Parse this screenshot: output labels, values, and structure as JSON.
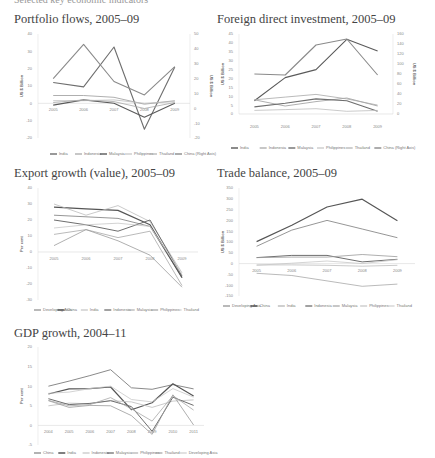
{
  "header": {
    "text": "Selected key economic indicators"
  },
  "chart_data": [
    {
      "id": "portfolio",
      "type": "line",
      "title": "Portfolio flows, 2005–09",
      "ylabel": "US $ Billion",
      "ylabel_right": "US $ Billion",
      "x": [
        "2005",
        "2006",
        "2007",
        "2008",
        "2009"
      ],
      "ylim": [
        -20,
        40
      ],
      "yticks": [
        40,
        30,
        20,
        10,
        0,
        -10,
        -20
      ],
      "ylim_right": [
        -20,
        50
      ],
      "yticks_right": [
        50,
        40,
        30,
        20,
        10,
        0,
        -10,
        -20
      ],
      "series": [
        {
          "name": "India",
          "values": [
            12,
            9.5,
            32.5,
            -15,
            21
          ],
          "color": "#6e6e6e",
          "width": 1.1
        },
        {
          "name": "Indonesia",
          "values": [
            4.5,
            4.5,
            3.5,
            -0.5,
            1.5
          ],
          "color": "#9a9a9a",
          "width": 0.8
        },
        {
          "name": "Malaysia",
          "values": [
            -1,
            2,
            0,
            -8,
            0
          ],
          "color": "#5a5a5a",
          "width": 1.1
        },
        {
          "name": "Philippines",
          "values": [
            1.5,
            1.5,
            2,
            0,
            1
          ],
          "color": "#bdbdbd",
          "width": 0.8
        },
        {
          "name": "Thailand",
          "values": [
            0.5,
            2,
            1,
            -3,
            0.5
          ],
          "color": "#a8a8a8",
          "width": 0.8
        },
        {
          "name": "China (Right Axis)",
          "values": [
            20,
            43,
            18,
            9,
            28
          ],
          "color": "#8a8a8a",
          "width": 1.1,
          "axis": "right"
        }
      ]
    },
    {
      "id": "fdi",
      "type": "line",
      "title": "Foreign direct investment, 2005–09",
      "ylabel": "US $ Billion",
      "ylabel_right": "US $ Billion",
      "x": [
        "2005",
        "2006",
        "2007",
        "2008",
        "2009"
      ],
      "ylim": [
        0,
        45
      ],
      "yticks": [
        45,
        40,
        35,
        30,
        25,
        20,
        15,
        10,
        5,
        0
      ],
      "ylim_right": [
        0,
        160
      ],
      "yticks_right": [
        160,
        140,
        120,
        100,
        80,
        60,
        40,
        20,
        0
      ],
      "series": [
        {
          "name": "India",
          "values": [
            7.5,
            20.5,
            25,
            42,
            35.5
          ],
          "color": "#5a5a5a",
          "width": 1.1
        },
        {
          "name": "Indonesia",
          "values": [
            8,
            4.5,
            7,
            9,
            4.5
          ],
          "color": "#9a9a9a",
          "width": 0.8
        },
        {
          "name": "Malaysia",
          "values": [
            4,
            6,
            8.5,
            7.5,
            1.5
          ],
          "color": "#6e6e6e",
          "width": 1.1
        },
        {
          "name": "Philippines",
          "values": [
            2,
            2.5,
            3,
            1.5,
            2
          ],
          "color": "#bdbdbd",
          "width": 0.8
        },
        {
          "name": "Thailand",
          "values": [
            8,
            9.5,
            11,
            8.5,
            5
          ],
          "color": "#a8a8a8",
          "width": 0.8
        },
        {
          "name": "China (Right Axis)",
          "values": [
            80,
            78,
            138,
            150,
            78
          ],
          "color": "#8a8a8a",
          "width": 1.1,
          "axis": "right"
        }
      ]
    },
    {
      "id": "export",
      "type": "line",
      "title": "Export growth (value), 2005–09",
      "ylabel": "Per cent",
      "x": [
        "2005",
        "2006",
        "2007",
        "2008",
        "2009"
      ],
      "ylim": [
        -30,
        40
      ],
      "yticks": [
        40,
        30,
        20,
        10,
        0,
        -10,
        -20,
        -30
      ],
      "series": [
        {
          "name": "Developing Asia",
          "values": [
            23,
            22,
            21,
            16,
            -16
          ],
          "color": "#8a8a8a",
          "width": 0.9
        },
        {
          "name": "China",
          "values": [
            28,
            27,
            26,
            17,
            -16
          ],
          "color": "#555555",
          "width": 1.2
        },
        {
          "name": "India",
          "values": [
            30,
            23,
            29,
            19,
            -13
          ],
          "color": "#bdbdbd",
          "width": 0.8
        },
        {
          "name": "Indonesia",
          "values": [
            20,
            17,
            13,
            20,
            -15
          ],
          "color": "#6e6e6e",
          "width": 1.0
        },
        {
          "name": "Malaysia",
          "values": [
            11,
            14,
            9,
            13,
            -21
          ],
          "color": "#a8a8a8",
          "width": 0.8
        },
        {
          "name": "Philippines",
          "values": [
            4,
            14,
            7,
            -2,
            -22
          ],
          "color": "#9a9a9a",
          "width": 0.8
        },
        {
          "name": "Thailand",
          "values": [
            15,
            17,
            18,
            16,
            -14
          ],
          "color": "#c8c8c8",
          "width": 0.8
        }
      ]
    },
    {
      "id": "trade",
      "type": "line",
      "title": "Trade balance, 2005–09",
      "ylabel": "US $ Billion",
      "x": [
        "2005",
        "2006",
        "2007",
        "2008",
        "2009"
      ],
      "ylim": [
        -150,
        350
      ],
      "yticks": [
        350,
        300,
        250,
        200,
        150,
        100,
        50,
        0,
        -50,
        -100,
        -150
      ],
      "series": [
        {
          "name": "Developing Asia",
          "values": [
            80,
            155,
            200,
            160,
            120
          ],
          "color": "#8a8a8a",
          "width": 0.9
        },
        {
          "name": "China",
          "values": [
            102,
            178,
            262,
            298,
            198
          ],
          "color": "#555555",
          "width": 1.2
        },
        {
          "name": "India",
          "values": [
            -45,
            -55,
            -80,
            -105,
            -95
          ],
          "color": "#a8a8a8",
          "width": 0.8
        },
        {
          "name": "Indonesia",
          "values": [
            28,
            38,
            38,
            8,
            20
          ],
          "color": "#6e6e6e",
          "width": 1.0
        },
        {
          "name": "Malaysia",
          "values": [
            28,
            30,
            30,
            42,
            32
          ],
          "color": "#9a9a9a",
          "width": 0.8
        },
        {
          "name": "Philippines",
          "values": [
            -6,
            -6,
            -8,
            -12,
            -8
          ],
          "color": "#bdbdbd",
          "width": 0.8
        },
        {
          "name": "Thailand",
          "values": [
            -8,
            2,
            12,
            0,
            18
          ],
          "color": "#c8c8c8",
          "width": 0.8
        }
      ]
    },
    {
      "id": "gdp",
      "type": "line",
      "title": "GDP growth, 2004–11",
      "ylabel": "Per cent",
      "x": [
        "2004",
        "2005",
        "2006",
        "2007",
        "2008",
        "2009",
        "2010",
        "2011"
      ],
      "ylim": [
        -5,
        20
      ],
      "yticks": [
        20,
        15,
        10,
        5,
        0,
        -5
      ],
      "series": [
        {
          "name": "China",
          "values": [
            10,
            11.3,
            12.7,
            14.2,
            9.6,
            9.2,
            10.4,
            9.3
          ],
          "color": "#8a8a8a",
          "width": 1.0
        },
        {
          "name": "India",
          "values": [
            8,
            9.3,
            9.4,
            9.8,
            4,
            5.8,
            10.6,
            7.5
          ],
          "color": "#555555",
          "width": 1.2
        },
        {
          "name": "Indonesia",
          "values": [
            5,
            5.7,
            5.5,
            6.3,
            6,
            4.6,
            6.2,
            6.5
          ],
          "color": "#bdbdbd",
          "width": 0.8
        },
        {
          "name": "Malaysia",
          "values": [
            6.8,
            5.3,
            5.6,
            6.3,
            4.8,
            -1.5,
            7.2,
            5.1
          ],
          "color": "#6e6e6e",
          "width": 1.0
        },
        {
          "name": "Philippines",
          "values": [
            6.4,
            5,
            5.3,
            7.1,
            4.2,
            1.1,
            7.6,
            3.9
          ],
          "color": "#a8a8a8",
          "width": 0.8
        },
        {
          "name": "Thailand",
          "values": [
            6.3,
            4.6,
            5.1,
            5,
            2.5,
            -2.3,
            7.8,
            0.1
          ],
          "color": "#9a9a9a",
          "width": 0.8
        },
        {
          "name": "Developing Asia",
          "values": [
            8.2,
            8.5,
            9.4,
            10,
            6.6,
            6,
            9.4,
            7.2
          ],
          "color": "#c8c8c8",
          "width": 0.8
        }
      ]
    }
  ]
}
